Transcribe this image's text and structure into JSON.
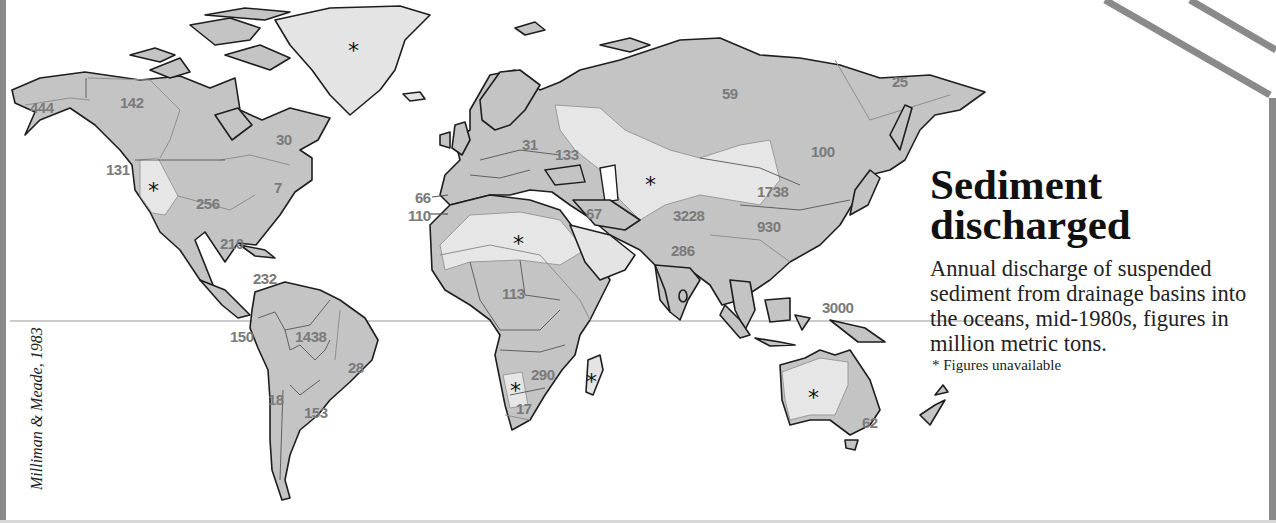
{
  "title": {
    "line1": "Sediment",
    "line2": "discharged"
  },
  "description": "Annual discharge of suspended sediment from drainage basins into the oceans, mid-1980s, figures in million metric tons.",
  "note": "* Figures unavailable",
  "credit": "Milliman & Meade, 1983",
  "colors": {
    "land_data": "#c4c4c4",
    "land_unavailable": "#e4e4e4",
    "label_gray": "#7a7a7a",
    "frame_gray": "#8a8a8a"
  },
  "regions": [
    {
      "name": "Alaska",
      "value": "444"
    },
    {
      "name": "Northern Canada",
      "value": "142"
    },
    {
      "name": "Eastern Canada",
      "value": "30"
    },
    {
      "name": "Pacific Northwest",
      "value": "131"
    },
    {
      "name": "Great Basin",
      "value": "*"
    },
    {
      "name": "Mississippi basin",
      "value": "256"
    },
    {
      "name": "US East Coast",
      "value": "7"
    },
    {
      "name": "Gulf of Mexico",
      "value": "210"
    },
    {
      "name": "Caribbean",
      "value": "232"
    },
    {
      "name": "Western South America",
      "value": "150"
    },
    {
      "name": "Amazon",
      "value": "1438"
    },
    {
      "name": "Eastern Brazil",
      "value": "28"
    },
    {
      "name": "Chile",
      "value": "18"
    },
    {
      "name": "La Plata",
      "value": "153"
    },
    {
      "name": "Greenland",
      "value": "*"
    },
    {
      "name": "Iberia Atlantic",
      "value": "66"
    },
    {
      "name": "NW Africa Atlantic",
      "value": "110"
    },
    {
      "name": "Northern Europe",
      "value": "31"
    },
    {
      "name": "Black Sea",
      "value": "133"
    },
    {
      "name": "Middle East",
      "value": "67"
    },
    {
      "name": "Sahara",
      "value": "*"
    },
    {
      "name": "Central Asia",
      "value": "*"
    },
    {
      "name": "Siberia",
      "value": "59"
    },
    {
      "name": "NE Siberia",
      "value": "25"
    },
    {
      "name": "Amur",
      "value": "100"
    },
    {
      "name": "Huang He",
      "value": "1738"
    },
    {
      "name": "Indus-Ganges",
      "value": "3228"
    },
    {
      "name": "Yangtze",
      "value": "930"
    },
    {
      "name": "India",
      "value": "286"
    },
    {
      "name": "Central Africa",
      "value": "113"
    },
    {
      "name": "Zambezi",
      "value": "290"
    },
    {
      "name": "Namibia",
      "value": "*"
    },
    {
      "name": "South Africa",
      "value": "17"
    },
    {
      "name": "Madagascar",
      "value": "*"
    },
    {
      "name": "Indonesia Oceania",
      "value": "3000"
    },
    {
      "name": "Australia interior",
      "value": "*"
    },
    {
      "name": "Eastern Australia",
      "value": "62"
    }
  ]
}
